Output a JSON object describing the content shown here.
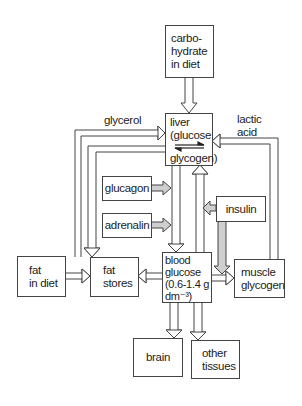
{
  "diagram": {
    "title": "",
    "nodes": {
      "carbohydrate": {
        "lines": [
          "carbo-",
          "hydrate",
          "in diet"
        ]
      },
      "liver": {
        "lines": [
          "liver",
          "(glucose",
          "glycogen)"
        ],
        "reversible_symbol": "⇌"
      },
      "glucagon": {
        "label": "glucagon"
      },
      "adrenalin": {
        "label": "adrenalin"
      },
      "insulin": {
        "label": "insulin"
      },
      "fat_in_diet": {
        "lines": [
          "fat",
          "in diet"
        ]
      },
      "fat_stores": {
        "lines": [
          "fat",
          "stores"
        ]
      },
      "blood_glucose": {
        "lines": [
          "blood",
          "glucose",
          "(0.6-1.4 g",
          "dm⁻³)"
        ]
      },
      "muscle_glycogen": {
        "lines": [
          "muscle",
          "glycogen"
        ]
      },
      "brain": {
        "label": "brain"
      },
      "other_tissues": {
        "lines": [
          "other",
          "tissues"
        ]
      }
    },
    "edge_labels": {
      "glycerol": "glycerol",
      "lactic_acid": [
        "lactic",
        "acid"
      ]
    },
    "edges": [
      {
        "from": "carbohydrate",
        "to": "liver"
      },
      {
        "from": "fat_stores",
        "to": "liver",
        "label": "glycerol"
      },
      {
        "from": "liver",
        "to": "fat_stores"
      },
      {
        "from": "liver",
        "to": "blood_glucose"
      },
      {
        "from": "blood_glucose",
        "to": "liver"
      },
      {
        "from": "glucagon",
        "to": "liver-blood pathway"
      },
      {
        "from": "adrenalin",
        "to": "liver-blood pathway"
      },
      {
        "from": "insulin",
        "to": "blood-liver pathway"
      },
      {
        "from": "insulin",
        "to": "muscle_glycogen"
      },
      {
        "from": "fat_in_diet",
        "to": "fat_stores"
      },
      {
        "from": "blood_glucose",
        "to": "fat_stores"
      },
      {
        "from": "blood_glucose",
        "to": "muscle_glycogen"
      },
      {
        "from": "muscle_glycogen",
        "to": "liver",
        "label": "lactic acid"
      },
      {
        "from": "blood_glucose",
        "to": "brain"
      },
      {
        "from": "blood_glucose",
        "to": "other_tissues"
      }
    ],
    "colors": {
      "line": "#444444",
      "hormone_arrow_fill": "#cccccc",
      "background": "#ffffff"
    }
  }
}
